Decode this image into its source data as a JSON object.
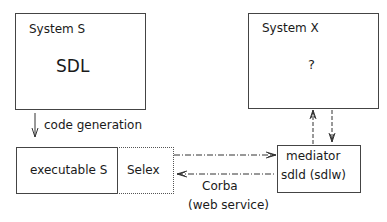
{
  "system_s": {
    "title": "System S",
    "content": "SDL"
  },
  "system_x": {
    "title": "System X",
    "content": "?"
  },
  "code_generation": {
    "label": "code generation"
  },
  "executable": {
    "label": "executable S"
  },
  "selex": {
    "label": "Selex"
  },
  "mediator": {
    "line1": "mediator",
    "line2": "sdld (sdlw)"
  },
  "connection": {
    "line1": "Corba",
    "line2": "(web service)"
  },
  "colors": {
    "stroke": "#444444",
    "text": "#1a1a1a",
    "background": "#ffffff"
  }
}
